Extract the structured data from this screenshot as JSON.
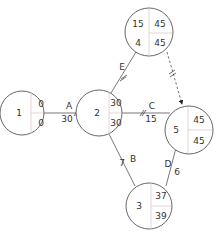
{
  "diagram": {
    "type": "activity-on-node network",
    "nodes": [
      {
        "id": "1",
        "early": "0",
        "late": "0"
      },
      {
        "id": "2",
        "early": "30",
        "late": "30"
      },
      {
        "id": "4",
        "early": "45",
        "late": "45",
        "extra": "15"
      },
      {
        "id": "5",
        "early": "45",
        "late": "45"
      },
      {
        "id": "3",
        "early": "37",
        "late": "39"
      }
    ],
    "edges": [
      {
        "from": "1",
        "to": "2",
        "activity": "A",
        "duration": "30",
        "critical": true
      },
      {
        "from": "2",
        "to": "4",
        "activity": "E",
        "duration": "",
        "critical": true
      },
      {
        "from": "2",
        "to": "5",
        "activity": "C",
        "duration": "15",
        "critical": true
      },
      {
        "from": "2",
        "to": "3",
        "activity": "B",
        "duration": "7",
        "critical": false
      },
      {
        "from": "3",
        "to": "5",
        "activity": "D",
        "duration": "6",
        "critical": false
      },
      {
        "from": "4",
        "to": "5",
        "activity": "",
        "duration": "",
        "critical": true,
        "dummy": true
      }
    ]
  }
}
